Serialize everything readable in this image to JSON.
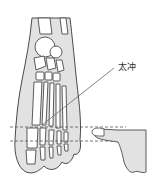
{
  "diagram": {
    "title": "",
    "labels": [
      {
        "id": "taichong",
        "text": "太冲"
      }
    ],
    "colors": {
      "outline": "#4a4a4a",
      "shade": "#e2e2e2",
      "bone": "#ffffff",
      "dashed": "#555555",
      "leader": "#666666"
    },
    "elements": [
      {
        "type": "foot-skeleton",
        "view": "dorsal"
      },
      {
        "type": "dashed-guide-lines",
        "count": 2
      },
      {
        "type": "hand-finger-pointer",
        "points_to": "left"
      },
      {
        "type": "leader-line",
        "from": "taichong-point",
        "to": "label"
      }
    ]
  }
}
